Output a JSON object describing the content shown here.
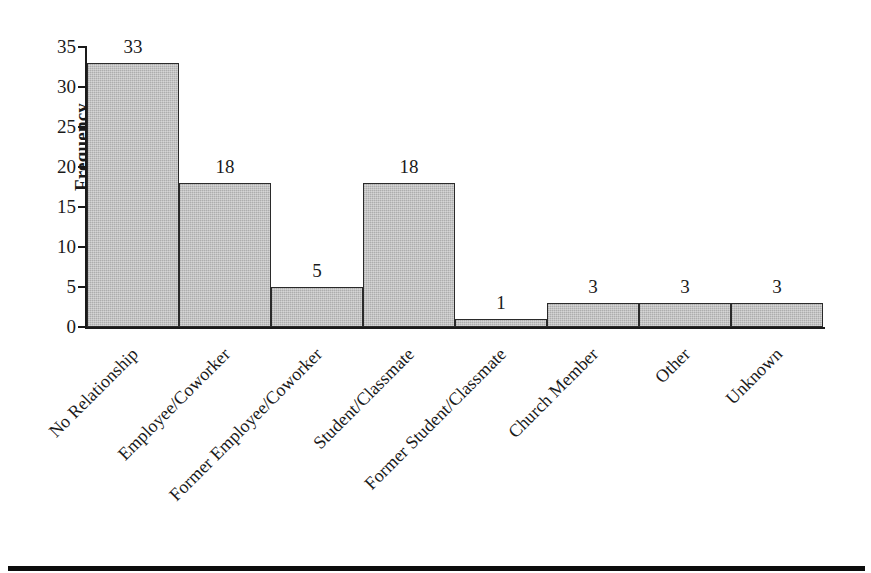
{
  "chart_data": {
    "type": "bar",
    "title": "",
    "subtitle": "",
    "xlabel": "",
    "ylabel": "Frequency",
    "ylim": [
      0,
      35
    ],
    "yticks": [
      0,
      5,
      10,
      15,
      20,
      25,
      30,
      35
    ],
    "ytick_labels": [
      "0",
      "5",
      "10",
      "15",
      "20",
      "25",
      "30",
      "35"
    ],
    "grid": false,
    "legend": false,
    "bar_style": "adjacent-histogram",
    "categories": [
      "No Relationship",
      "Employee/Coworker",
      "Former Employee/Coworker",
      "Student/Classmate",
      "Former Student/Classmate",
      "Church Member",
      "Other",
      "Unknown"
    ],
    "values": [
      33,
      18,
      5,
      18,
      1,
      3,
      3,
      3
    ],
    "data_labels": [
      "33",
      "18",
      "5",
      "18",
      "1",
      "3",
      "3",
      "3"
    ],
    "colors": {
      "bar_fill": "#b6b6b6",
      "bar_edge": "#2a2a2a",
      "axis": "#1a1a1a",
      "text": "#1a1a1a",
      "background": "#ffffff",
      "bottom_rule": "#0d0d0d"
    }
  },
  "axis": {
    "y_title": "Frequency"
  }
}
